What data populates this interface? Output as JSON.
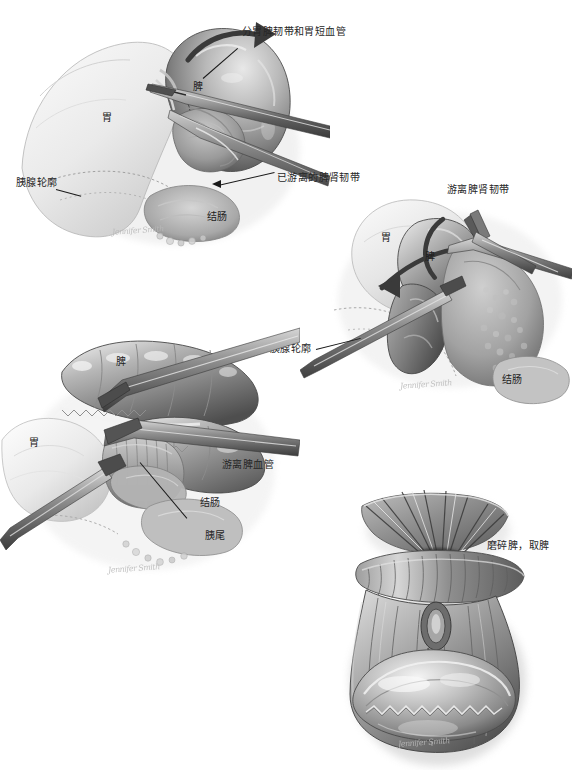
{
  "figure": {
    "background_color": "#ffffff",
    "ink_color": "#1a1a1a",
    "width": 572,
    "height": 779
  },
  "panels": [
    {
      "id": "panel-1",
      "name": "分胃脾韧带和胃短血管",
      "position": "top-left",
      "callouts": [
        {
          "name": "callout-gastrosplenic-ligament",
          "text": "分胃脾韧带和胃短血管",
          "x": 242,
          "y": 26,
          "leader": true
        },
        {
          "name": "callout-pancreas-outline",
          "text": "胰腺轮廓",
          "x": 16,
          "y": 177,
          "leader": true
        },
        {
          "name": "callout-mobilized-splenorenal-ligament",
          "text": "已游离的脾肾韧带",
          "x": 277,
          "y": 172,
          "leader": true
        }
      ],
      "organ_labels": [
        {
          "name": "organ-label-spleen",
          "text": "脾",
          "x": 193,
          "y": 81
        },
        {
          "name": "organ-label-stomach",
          "text": "胃",
          "x": 102,
          "y": 112
        },
        {
          "name": "organ-label-colon",
          "text": "结肠",
          "x": 207,
          "y": 211
        }
      ],
      "signature": "Jennifer Smith"
    },
    {
      "id": "panel-2",
      "name": "游离脾肾韧带",
      "position": "top-right",
      "callouts": [
        {
          "name": "callout-mobilize-splenorenal-ligament",
          "text": "游离脾肾韧带",
          "x": 447,
          "y": 184,
          "leader": false
        },
        {
          "name": "callout-pancreas-outline",
          "text": "胰腺轮廓",
          "x": 270,
          "y": 343,
          "leader": true
        }
      ],
      "organ_labels": [
        {
          "name": "organ-label-stomach",
          "text": "胃",
          "x": 381,
          "y": 232
        },
        {
          "name": "organ-label-spleen",
          "text": "脾",
          "x": 425,
          "y": 251
        },
        {
          "name": "organ-label-colon",
          "text": "结肠",
          "x": 502,
          "y": 374
        }
      ],
      "signature": "Jennifer Smith"
    },
    {
      "id": "panel-3",
      "name": "游离脾血管",
      "position": "middle-left",
      "callouts": [
        {
          "name": "callout-mobilize-splenic-vessels",
          "text": "游离脾血管",
          "x": 222,
          "y": 459,
          "leader": false
        },
        {
          "name": "callout-pancreatic-tail",
          "text": "胰尾",
          "x": 205,
          "y": 530,
          "leader": true
        }
      ],
      "organ_labels": [
        {
          "name": "organ-label-spleen",
          "text": "脾",
          "x": 116,
          "y": 356
        },
        {
          "name": "organ-label-stomach",
          "text": "胃",
          "x": 29,
          "y": 437
        },
        {
          "name": "organ-label-colon",
          "text": "结肠",
          "x": 200,
          "y": 497
        }
      ],
      "signature": "Jennifer Smith"
    },
    {
      "id": "panel-4",
      "name": "磨碎脾，取脾",
      "position": "bottom-right",
      "callouts": [
        {
          "name": "callout-morcellate-and-remove-spleen",
          "text": "磨碎脾，取脾",
          "x": 487,
          "y": 540,
          "leader": false
        }
      ],
      "organ_labels": [],
      "signature": "Jennifer Smith"
    }
  ]
}
